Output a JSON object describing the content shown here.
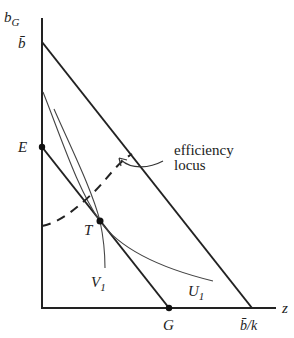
{
  "diagram": {
    "type": "economics-budget-diagram",
    "axes": {
      "y_label": "b",
      "y_label_sub": "G",
      "x_label": "z"
    },
    "points": {
      "b_bar": {
        "label": "b̄"
      },
      "E": {
        "label": "E"
      },
      "T": {
        "label": "T"
      },
      "G": {
        "label": "G"
      },
      "b_bar_over_k": {
        "label": "b̄/k"
      }
    },
    "curves": {
      "U1": {
        "label": "U",
        "sub": "1"
      },
      "V1": {
        "label": "V",
        "sub": "1"
      },
      "efficiency_locus": {
        "label_line1": "efficiency",
        "label_line2": "locus"
      }
    },
    "colors": {
      "ink": "#222222",
      "thin": "#444444"
    }
  }
}
